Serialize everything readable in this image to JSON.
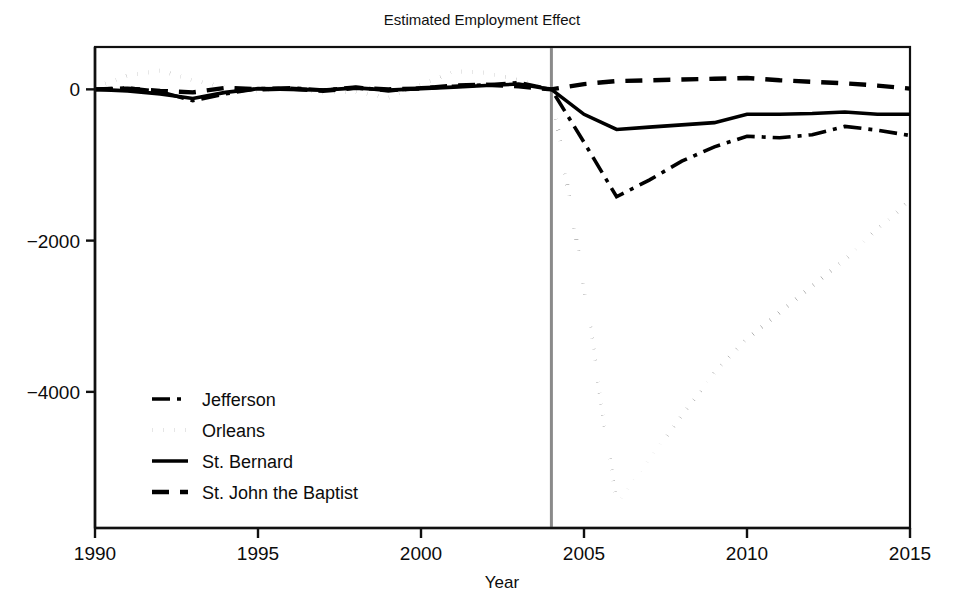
{
  "chart_data": {
    "type": "line",
    "title": "Estimated Employment Effect",
    "xlabel": "Year",
    "ylabel": "",
    "xlim": [
      1990,
      2015
    ],
    "ylim": [
      -5800,
      560
    ],
    "xticks": [
      1990,
      1995,
      2000,
      2005,
      2010,
      2015
    ],
    "xticklabels": [
      "1990",
      "1995",
      "2000",
      "2005",
      "2010",
      "2015"
    ],
    "yticks": [
      0,
      -2000,
      -4000
    ],
    "yticklabels": [
      "0",
      "−2000",
      "−4000"
    ],
    "grid": false,
    "legend_position": "lower left",
    "annotations": [
      {
        "type": "vertical-line",
        "x": 2004,
        "color": "#8a8a8a",
        "label": "treatment-year-2004"
      }
    ],
    "x": [
      1990,
      1991,
      1992,
      1993,
      1994,
      1995,
      1996,
      1997,
      1998,
      1999,
      2000,
      2001,
      2002,
      2003,
      2004,
      2005,
      2006,
      2007,
      2008,
      2009,
      2010,
      2011,
      2012,
      2013,
      2014,
      2015
    ],
    "series": [
      {
        "name": "Jefferson",
        "style": "dashdot",
        "color": "#000000",
        "values": [
          0,
          20,
          -30,
          -150,
          -60,
          10,
          20,
          -10,
          30,
          -20,
          20,
          40,
          60,
          90,
          0,
          -700,
          -1420,
          -1200,
          -950,
          -760,
          -620,
          -640,
          -600,
          -490,
          -540,
          -610
        ]
      },
      {
        "name": "Orleans",
        "style": "dotted",
        "color": "#000000",
        "values": [
          30,
          180,
          250,
          120,
          30,
          -20,
          20,
          -40,
          -30,
          -110,
          60,
          240,
          220,
          120,
          0,
          -2600,
          -5500,
          -4900,
          -4300,
          -3750,
          -3300,
          -2950,
          -2600,
          -2250,
          -1850,
          -1470
        ]
      },
      {
        "name": "St. Bernard",
        "style": "solid",
        "color": "#000000",
        "values": [
          0,
          -20,
          -60,
          -120,
          -40,
          10,
          0,
          -10,
          20,
          -10,
          10,
          30,
          50,
          70,
          0,
          -330,
          -530,
          -500,
          -470,
          -440,
          -330,
          -330,
          -320,
          -300,
          -330,
          -330
        ]
      },
      {
        "name": "St. John the Baptist",
        "style": "dashed",
        "color": "#000000",
        "values": [
          0,
          10,
          -20,
          -40,
          20,
          0,
          10,
          -20,
          20,
          0,
          10,
          50,
          60,
          40,
          0,
          70,
          110,
          120,
          130,
          140,
          150,
          120,
          100,
          80,
          50,
          10
        ]
      }
    ]
  },
  "legend": {
    "items": [
      {
        "label": "Jefferson",
        "style": "dashdot"
      },
      {
        "label": "Orleans",
        "style": "dotted"
      },
      {
        "label": "St. Bernard",
        "style": "solid"
      },
      {
        "label": "St. John the Baptist",
        "style": "dashed"
      }
    ]
  }
}
